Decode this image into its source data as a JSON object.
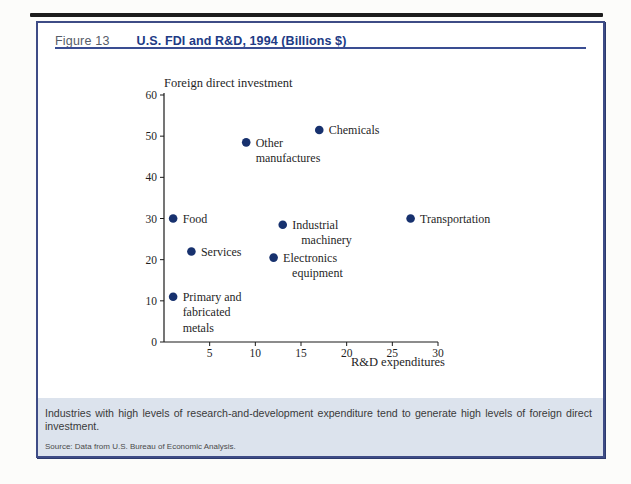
{
  "figure": {
    "number": "Figure 13",
    "title": "U.S. FDI and R&D, 1994 (Billions $)"
  },
  "chart_data": {
    "type": "scatter",
    "title": "U.S. FDI and R&D, 1994 (Billions $)",
    "xlabel": "R&D expenditures",
    "ylabel": "Foreign direct investment",
    "xlim": [
      0,
      30
    ],
    "ylim": [
      0,
      60
    ],
    "x_ticks": [
      5,
      10,
      15,
      20,
      25,
      30
    ],
    "y_ticks": [
      60,
      50,
      40,
      30,
      20,
      10,
      0
    ],
    "grid": false,
    "point_color": "#17316e",
    "points": [
      {
        "name": "food",
        "x": 1,
        "y": 30,
        "label_lines": [
          "Food"
        ],
        "label_align": "left"
      },
      {
        "name": "services",
        "x": 3,
        "y": 22,
        "label_lines": [
          "Services"
        ],
        "label_align": "left"
      },
      {
        "name": "primary-and-fabricated-metals",
        "x": 1,
        "y": 11,
        "label_lines": [
          "Primary and",
          "fabricated",
          "metals"
        ],
        "label_align": "left"
      },
      {
        "name": "other-manufactures",
        "x": 9,
        "y": 48.5,
        "label_lines": [
          "Other",
          "manufactures"
        ],
        "label_align": "left"
      },
      {
        "name": "chemicals",
        "x": 17,
        "y": 51.5,
        "label_lines": [
          "Chemicals"
        ],
        "label_align": "left"
      },
      {
        "name": "industrial-machinery",
        "x": 13,
        "y": 28.5,
        "label_lines": [
          "Industrial",
          "machinery"
        ],
        "label_align": "center"
      },
      {
        "name": "electronics-equipment",
        "x": 12,
        "y": 20.5,
        "label_lines": [
          "Electronics",
          "equipment"
        ],
        "label_align": "center"
      },
      {
        "name": "transportation",
        "x": 27,
        "y": 30,
        "label_lines": [
          "Transportation"
        ],
        "label_align": "left"
      }
    ]
  },
  "caption": {
    "text": "Industries with high levels of research-and-development expenditure tend to generate high levels of foreign direct investment.",
    "source": "Source: Data from U.S. Bureau of Economic Analysis."
  },
  "colors": {
    "title_navy": "#203a85",
    "figure_number_gray": "#565c68",
    "box_border": "#3e4c86",
    "header_rule": "#3a4d92",
    "caption_background": "#dce3ed",
    "data_point": "#17316e",
    "axis": "#1a1a1a"
  }
}
